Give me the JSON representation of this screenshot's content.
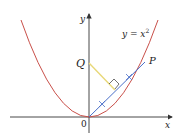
{
  "diagram": {
    "equation_label": "y = x",
    "equation_exponent": "2",
    "axis_x_label": "x",
    "axis_y_label": "y",
    "origin_label": "0",
    "point_q_label": "Q",
    "point_p_label": "P",
    "colors": {
      "parabola": "#c9504a",
      "segment_op": "#4a6fc9",
      "segment_q_perp": "#e8d878",
      "axes": "#333333"
    }
  }
}
